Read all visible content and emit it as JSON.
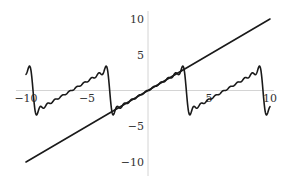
{
  "chart_data": {
    "type": "line",
    "title": "",
    "xlabel": "",
    "ylabel": "",
    "xlim": [
      -10,
      10
    ],
    "ylim": [
      -10,
      10
    ],
    "grid": false,
    "legend": null,
    "x_ticks": [
      -10,
      -5,
      5,
      10
    ],
    "y_ticks": [
      10,
      5,
      -5,
      -10
    ],
    "x_tick_labels": [
      "−10",
      "−5",
      "5",
      "10"
    ],
    "y_tick_labels": [
      "10",
      "5",
      "−5",
      "−10"
    ],
    "series": [
      {
        "name": "y = x",
        "kind": "linear",
        "slope": 1,
        "intercept": 0,
        "x": [
          -10,
          10
        ],
        "y": [
          -10,
          10
        ],
        "color": "#1a1a1a"
      },
      {
        "name": "Fourier partial sum of sawtooth (period 2π)",
        "kind": "fourier_sawtooth",
        "terms": 10,
        "formula": "sum_{k=1}^{N} 2(-1)^(k+1) sin(kx)/k",
        "x_range": [
          -10,
          10
        ],
        "approx_peak": 3.6,
        "approx_trough": -3.6,
        "color": "#1a1a1a"
      }
    ]
  },
  "layout": {
    "origin_px": [
      148,
      90.5
    ],
    "x_scale_px_per_unit": 12.2,
    "y_scale_px_per_unit": 7.15
  }
}
